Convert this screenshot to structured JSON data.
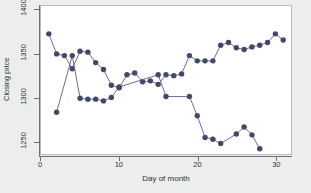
{
  "chart_data": {
    "type": "line",
    "title": "",
    "subtitle": "",
    "xlabel": "Day of month",
    "ylabel": "Closing price",
    "xlim": [
      0,
      32
    ],
    "ylim": [
      1235,
      1405
    ],
    "xticks": [
      0,
      10,
      20,
      30
    ],
    "xticklabels": [
      "0",
      "10",
      "20",
      "30"
    ],
    "yticks": [
      1250,
      1300,
      1350,
      1400
    ],
    "yticklabels": [
      "1250",
      "1300",
      "1350",
      "1400"
    ],
    "grid": false,
    "legend": "none",
    "marker": "filled-circle",
    "marker_color": "#44476b",
    "line_color": "#5a5d80",
    "series": [
      {
        "name": "series-a",
        "x": [
          1,
          2,
          3,
          4,
          5,
          6,
          7,
          8,
          9,
          10,
          11,
          12,
          13,
          14,
          15,
          16,
          17,
          18,
          19,
          20,
          21,
          22,
          23,
          24,
          25,
          26,
          27,
          28,
          29,
          30,
          31
        ],
        "values": [
          1373,
          1350,
          1348,
          1333,
          1353,
          1352,
          1340,
          1332,
          1314,
          1311,
          1326,
          1328,
          1318,
          1319,
          1315,
          1326,
          1325,
          1327,
          1348,
          1342,
          1342,
          1342,
          1360,
          1363,
          1357,
          1355,
          1358,
          1360,
          1363,
          1373,
          1366
        ]
      },
      {
        "name": "series-b",
        "x": [
          2,
          4,
          5,
          6,
          7,
          8,
          9,
          10,
          15,
          16,
          19,
          20,
          21,
          22,
          23,
          25,
          26,
          27,
          28
        ],
        "values": [
          1283,
          1348,
          1299,
          1298,
          1298,
          1296,
          1300,
          1312,
          1326,
          1301,
          1301,
          1279,
          1254,
          1252,
          1247,
          1258,
          1266,
          1257,
          1241
        ]
      }
    ]
  }
}
